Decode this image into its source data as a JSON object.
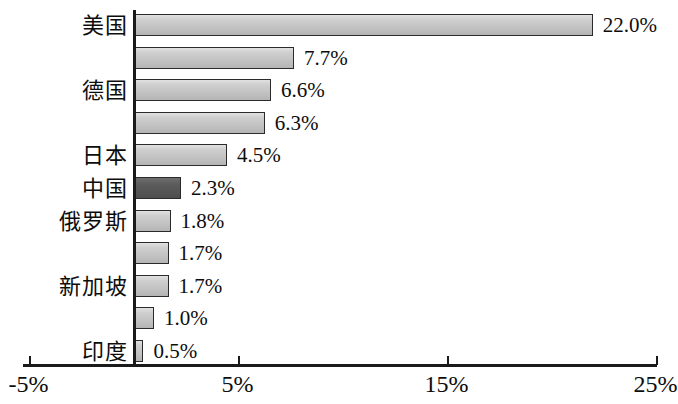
{
  "chart_data": {
    "type": "bar",
    "orientation": "horizontal",
    "title": "",
    "subtitle": "",
    "xlabel": "",
    "ylabel": "",
    "grid": false,
    "legend": false,
    "xlim": [
      -5,
      25
    ],
    "xticks": [
      "-5%",
      "5%",
      "15%",
      "25%"
    ],
    "xtick_values": [
      -5,
      5,
      15,
      25
    ],
    "categories": [
      "美国",
      "",
      "德国",
      "",
      "日本",
      "中国",
      "俄罗斯",
      "",
      "新加坡",
      "",
      "印度"
    ],
    "bars": [
      {
        "category": "美国",
        "value": 22.0,
        "label": "22.0%",
        "highlight": false
      },
      {
        "category": "",
        "value": 7.7,
        "label": "7.7%",
        "highlight": false
      },
      {
        "category": "德国",
        "value": 6.6,
        "label": "6.6%",
        "highlight": false
      },
      {
        "category": "",
        "value": 6.3,
        "label": "6.3%",
        "highlight": false
      },
      {
        "category": "日本",
        "value": 4.5,
        "label": "4.5%",
        "highlight": false
      },
      {
        "category": "中国",
        "value": 2.3,
        "label": "2.3%",
        "highlight": true
      },
      {
        "category": "俄罗斯",
        "value": 1.8,
        "label": "1.8%",
        "highlight": false
      },
      {
        "category": "",
        "value": 1.7,
        "label": "1.7%",
        "highlight": false
      },
      {
        "category": "新加坡",
        "value": 1.7,
        "label": "1.7%",
        "highlight": false
      },
      {
        "category": "",
        "value": 1.0,
        "label": "1.0%",
        "highlight": false
      },
      {
        "category": "印度",
        "value": 0.5,
        "label": "0.5%",
        "highlight": false
      }
    ],
    "values": [
      22.0,
      7.7,
      6.6,
      6.3,
      4.5,
      2.3,
      1.8,
      1.7,
      1.7,
      1.0,
      0.5
    ],
    "colors": {
      "bar_fill": "#c9c9c9",
      "bar_highlight_fill": "#565656",
      "bar_border": "#2b2b2b",
      "axis": "#1a1a1a",
      "text": "#0d0d0d",
      "background": "#ffffff"
    }
  },
  "layout": {
    "zero_x_px": 133,
    "px_per_percent": 20.9,
    "first_bar_top_px": 14,
    "row_step_px": 32.6,
    "bar_height_px": 22,
    "axis_y_px": 364
  }
}
